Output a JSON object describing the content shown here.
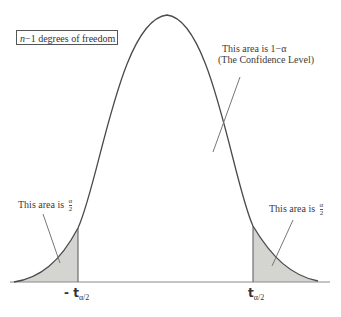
{
  "diagram": {
    "type": "t-distribution confidence interval",
    "df_box": {
      "var": "n",
      "suffix": "−1  degrees of freedom"
    },
    "center_label": {
      "line1": "This area is 1−α",
      "line2": "(The Confidence Level)"
    },
    "left_tail_label": {
      "prefix": "This area is",
      "num": "α",
      "den": "2"
    },
    "right_tail_label": {
      "prefix": "This area is",
      "num": "α",
      "den": "2"
    },
    "left_tick": {
      "main": "- t",
      "sub": "α/2"
    },
    "right_tick": {
      "main": "t",
      "sub": "α/2"
    },
    "colors": {
      "curve": "#4a4a4a",
      "shade": "#d4d4d0",
      "axis": "#8a8a8a",
      "pointer": "#777777"
    }
  }
}
